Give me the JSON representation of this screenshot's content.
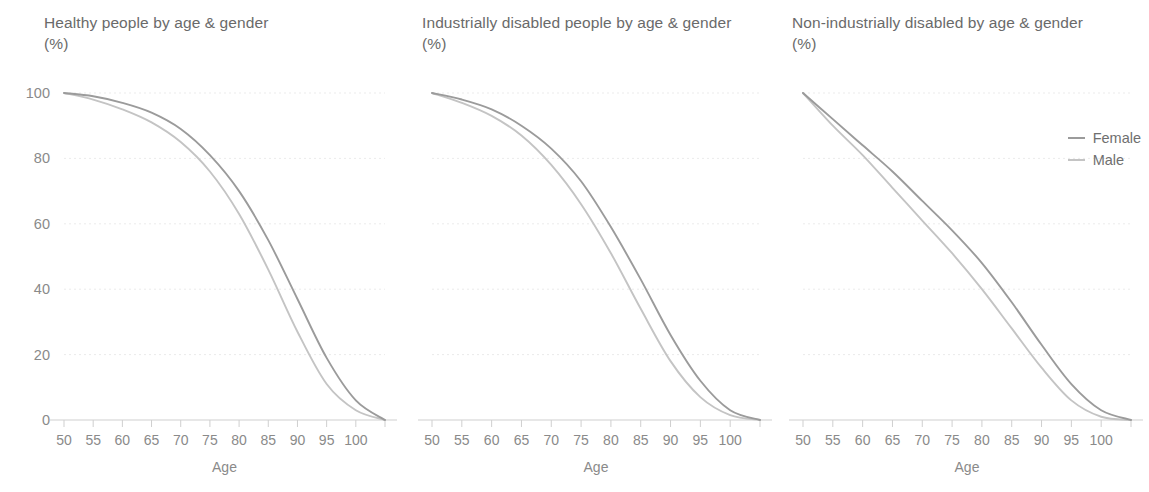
{
  "legend": {
    "position": "right",
    "items": [
      {
        "label": "Female",
        "color": "#9b9b9b"
      },
      {
        "label": "Male",
        "color": "#c4c4c4"
      }
    ]
  },
  "colors": {
    "female": "#9b9b9b",
    "male": "#c4c4c4",
    "axis": "#cfcfcf",
    "grid": "#ebebeb",
    "text": "#6f6f6f"
  },
  "chart_data": [
    {
      "type": "line",
      "title": "Healthy people by age & gender",
      "subtitle": "(%)",
      "xlabel": "Age",
      "ylabel": "(%)",
      "xlim": [
        50,
        105
      ],
      "ylim": [
        0,
        100
      ],
      "grid": true,
      "xticks": [
        50,
        55,
        60,
        65,
        70,
        75,
        80,
        85,
        90,
        95,
        100
      ],
      "yticks": [
        0,
        20,
        40,
        60,
        80,
        100
      ],
      "x": [
        50,
        55,
        60,
        65,
        70,
        75,
        80,
        85,
        90,
        95,
        100,
        105
      ],
      "series": [
        {
          "name": "Female",
          "values": [
            100,
            99,
            97,
            94,
            89,
            81,
            70,
            55,
            37,
            19,
            6,
            0
          ]
        },
        {
          "name": "Male",
          "values": [
            100,
            98,
            95,
            91,
            85,
            76,
            63,
            46,
            27,
            11,
            3,
            0
          ]
        }
      ]
    },
    {
      "type": "line",
      "title": "Industrially disabled people by age & gender",
      "subtitle": "(%)",
      "xlabel": "Age",
      "ylabel": "(%)",
      "xlim": [
        50,
        105
      ],
      "ylim": [
        0,
        100
      ],
      "grid": true,
      "xticks": [
        50,
        55,
        60,
        65,
        70,
        75,
        80,
        85,
        90,
        95,
        100
      ],
      "yticks": [
        0,
        20,
        40,
        60,
        80,
        100
      ],
      "x": [
        50,
        55,
        60,
        65,
        70,
        75,
        80,
        85,
        90,
        95,
        100,
        105
      ],
      "series": [
        {
          "name": "Female",
          "values": [
            100,
            98,
            95,
            90,
            83,
            73,
            59,
            43,
            26,
            12,
            3,
            0
          ]
        },
        {
          "name": "Male",
          "values": [
            100,
            97,
            93,
            87,
            78,
            66,
            51,
            34,
            18,
            7,
            1.5,
            0
          ]
        }
      ]
    },
    {
      "type": "line",
      "title": "Non-industrially disabled by age & gender",
      "subtitle": "(%)",
      "xlabel": "Age",
      "ylabel": "(%)",
      "xlim": [
        50,
        105
      ],
      "ylim": [
        0,
        100
      ],
      "grid": true,
      "xticks": [
        50,
        55,
        60,
        65,
        70,
        75,
        80,
        85,
        90,
        95,
        100
      ],
      "yticks": [
        0,
        20,
        40,
        60,
        80,
        100
      ],
      "x": [
        50,
        55,
        60,
        65,
        70,
        75,
        80,
        85,
        90,
        95,
        100,
        105
      ],
      "series": [
        {
          "name": "Female",
          "values": [
            100,
            92,
            84,
            76,
            67,
            58,
            48,
            36,
            23,
            11,
            3,
            0
          ]
        },
        {
          "name": "Male",
          "values": [
            100,
            90,
            81,
            71,
            61,
            51,
            40,
            28,
            16,
            6,
            1,
            0
          ]
        }
      ]
    }
  ]
}
